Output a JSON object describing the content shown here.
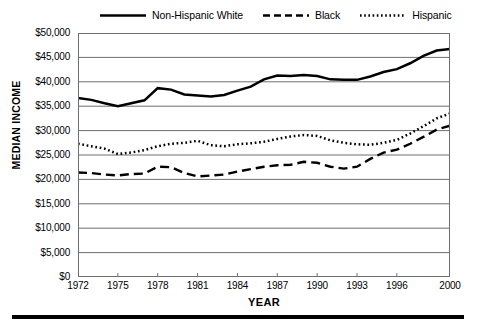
{
  "chart_data": {
    "type": "line",
    "title": "",
    "xlabel": "YEAR",
    "ylabel": "MEDIAN INCOME",
    "xlim": [
      1972,
      2000
    ],
    "ylim": [
      0,
      50000
    ],
    "grid": true,
    "legend_position": "top",
    "y_ticks": [
      0,
      5000,
      10000,
      15000,
      20000,
      25000,
      30000,
      35000,
      40000,
      45000,
      50000
    ],
    "y_tick_labels": [
      "$0",
      "$5,000",
      "$10,000",
      "$15,000",
      "$20,000",
      "$25,000",
      "$30,000",
      "$35,000",
      "$40,000",
      "$45,000",
      "$50,000"
    ],
    "x_ticks": [
      1972,
      1975,
      1978,
      1981,
      1984,
      1987,
      1990,
      1993,
      1996,
      2000
    ],
    "x_tick_labels": [
      "1972",
      "1975",
      "1978",
      "1981",
      "1984",
      "1987",
      "1990",
      "1993",
      "1996",
      "2000"
    ],
    "x": [
      1972,
      1973,
      1974,
      1975,
      1976,
      1977,
      1978,
      1979,
      1980,
      1981,
      1982,
      1983,
      1984,
      1985,
      1986,
      1987,
      1988,
      1989,
      1990,
      1991,
      1992,
      1993,
      1994,
      1995,
      1996,
      1997,
      1998,
      1999,
      2000
    ],
    "series": [
      {
        "name": "Non-Hispanic White",
        "style": "solid",
        "color": "#000000",
        "values": [
          36700,
          36300,
          35600,
          35000,
          35600,
          36200,
          38700,
          38400,
          37400,
          37200,
          37000,
          37300,
          38200,
          39000,
          40500,
          41300,
          41200,
          41400,
          41200,
          40500,
          40400,
          40400,
          41100,
          42000,
          42600,
          43800,
          45300,
          46400,
          46700
        ]
      },
      {
        "name": "Black",
        "style": "dashed",
        "color": "#000000",
        "values": [
          21400,
          21300,
          21000,
          20800,
          21100,
          21200,
          22600,
          22500,
          21300,
          20600,
          20800,
          21000,
          21600,
          22100,
          22600,
          22900,
          23000,
          23600,
          23400,
          22600,
          22200,
          22600,
          24200,
          25500,
          26100,
          27300,
          28700,
          30200,
          31000
        ]
      },
      {
        "name": "Hispanic",
        "style": "dotted",
        "color": "#000000",
        "values": [
          27300,
          26800,
          26300,
          25200,
          25500,
          26000,
          26800,
          27300,
          27500,
          27900,
          27000,
          26800,
          27200,
          27400,
          27700,
          28300,
          28800,
          29100,
          28900,
          28000,
          27500,
          27200,
          27100,
          27500,
          28100,
          29400,
          30900,
          32500,
          33500
        ]
      }
    ]
  },
  "legend": {
    "entries": [
      {
        "label": "Non-Hispanic White",
        "swatch": "solid-line-swatch"
      },
      {
        "label": "Black",
        "swatch": "dashed-line-swatch"
      },
      {
        "label": "Hispanic",
        "swatch": "dotted-line-swatch"
      }
    ]
  }
}
